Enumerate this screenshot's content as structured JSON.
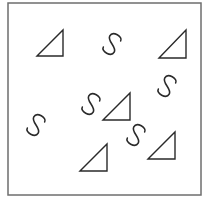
{
  "figure": {
    "stroke_color": "#2a2a2a",
    "frame_color": "#6e6e6e",
    "background": "#ffffff",
    "frame": {
      "x": 8,
      "y": 3,
      "width": 193,
      "height": 192
    },
    "triangles": [
      {
        "id": "triangle-1",
        "points": [
          [
            37,
            56
          ],
          [
            63,
            30
          ],
          [
            63,
            56
          ]
        ]
      },
      {
        "id": "triangle-2",
        "points": [
          [
            159,
            58
          ],
          [
            186,
            30
          ],
          [
            186,
            58
          ]
        ]
      },
      {
        "id": "triangle-3",
        "points": [
          [
            103,
            120
          ],
          [
            130,
            93
          ],
          [
            130,
            120
          ]
        ]
      },
      {
        "id": "triangle-4",
        "points": [
          [
            80,
            171
          ],
          [
            107,
            144
          ],
          [
            107,
            171
          ]
        ]
      },
      {
        "id": "triangle-5",
        "points": [
          [
            148,
            159
          ],
          [
            175,
            132
          ],
          [
            175,
            159
          ]
        ]
      }
    ],
    "s_shapes": [
      {
        "id": "s-shape-1",
        "cx": 112,
        "cy": 44,
        "rotate": 30
      },
      {
        "id": "s-shape-2",
        "cx": 167,
        "cy": 86,
        "rotate": 30
      },
      {
        "id": "s-shape-3",
        "cx": 91,
        "cy": 104,
        "rotate": 30
      },
      {
        "id": "s-shape-4",
        "cx": 36,
        "cy": 125,
        "rotate": 30
      },
      {
        "id": "s-shape-5",
        "cx": 136,
        "cy": 135,
        "rotate": 30
      }
    ]
  }
}
